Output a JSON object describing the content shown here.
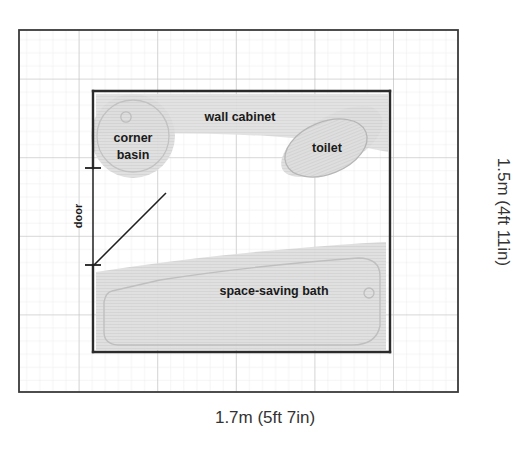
{
  "plan": {
    "title": "Small bathroom floor plan",
    "dimensions": {
      "width_label": "1.7m (5ft 7in)",
      "height_label": "1.5m (4ft 11in)"
    },
    "fixtures": [
      {
        "id": "corner-basin",
        "label": "corner basin",
        "label_line1": "corner",
        "label_line2": "basin"
      },
      {
        "id": "wall-cabinet",
        "label": "wall cabinet"
      },
      {
        "id": "toilet",
        "label": "toilet"
      },
      {
        "id": "space-saving-bath",
        "label": "space-saving bath"
      }
    ],
    "door": {
      "label": "door"
    },
    "colors": {
      "paper": "#ffffff",
      "grid_minor": "#e9e9ea",
      "grid_major": "#b9b9bb",
      "frame": "#3a3a3a",
      "room_wall": "#2b2b2b",
      "fixture_fill": "#dcdcdc",
      "fixture_stroke": "#b4b4b4",
      "cabinet_fill": "#dedede",
      "text": "#1a1a1a",
      "door_line": "#1f1f1f"
    },
    "grid": {
      "minor_step_px": 13.1,
      "major_step_px": 78.6
    }
  }
}
